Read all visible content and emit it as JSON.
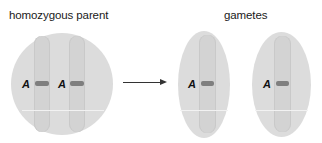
{
  "labels": {
    "parent_title": "homozygous parent",
    "gametes_title": "gametes"
  },
  "parent_cell": {
    "shape": "circle",
    "chromosomes": [
      {
        "allele": "A"
      },
      {
        "allele": "A"
      }
    ]
  },
  "gametes": [
    {
      "shape": "ellipse",
      "chromosomes": [
        {
          "allele": "A"
        }
      ]
    },
    {
      "shape": "ellipse",
      "chromosomes": [
        {
          "allele": "A"
        }
      ]
    }
  ],
  "arrow": {
    "direction": "right",
    "icon": "right-arrow-icon"
  },
  "colors": {
    "cell_fill": "#dcdcdc",
    "chromosome_fill": "#d3d3d3",
    "allele_band": "#7f7f7f",
    "text": "#1a1a1a"
  }
}
